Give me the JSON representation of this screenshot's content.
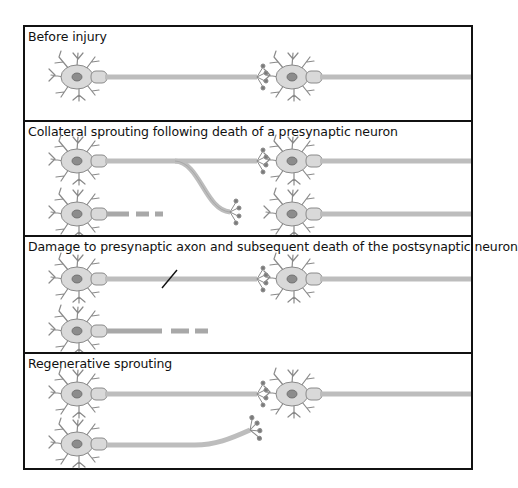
{
  "figure": {
    "panels": [
      {
        "id": "before-injury",
        "title": "Before injury"
      },
      {
        "id": "collateral-sprouting",
        "title": "Collateral sprouting following death of a presynaptic neuron"
      },
      {
        "id": "axon-damage",
        "title": "Damage to presynaptic axon and subsequent death of the postsynaptic neuron"
      },
      {
        "id": "regenerative-sprouting",
        "title": "Regenerative sprouting"
      }
    ]
  },
  "colors": {
    "border": "#111111",
    "neuron_fill": "#d9d9d9",
    "neuron_stroke": "#8a8a8a",
    "nucleus": "#8c8c8c",
    "axon": "#bdbdbd",
    "terminal": "#7a7a7a",
    "lesion": "#111111"
  }
}
